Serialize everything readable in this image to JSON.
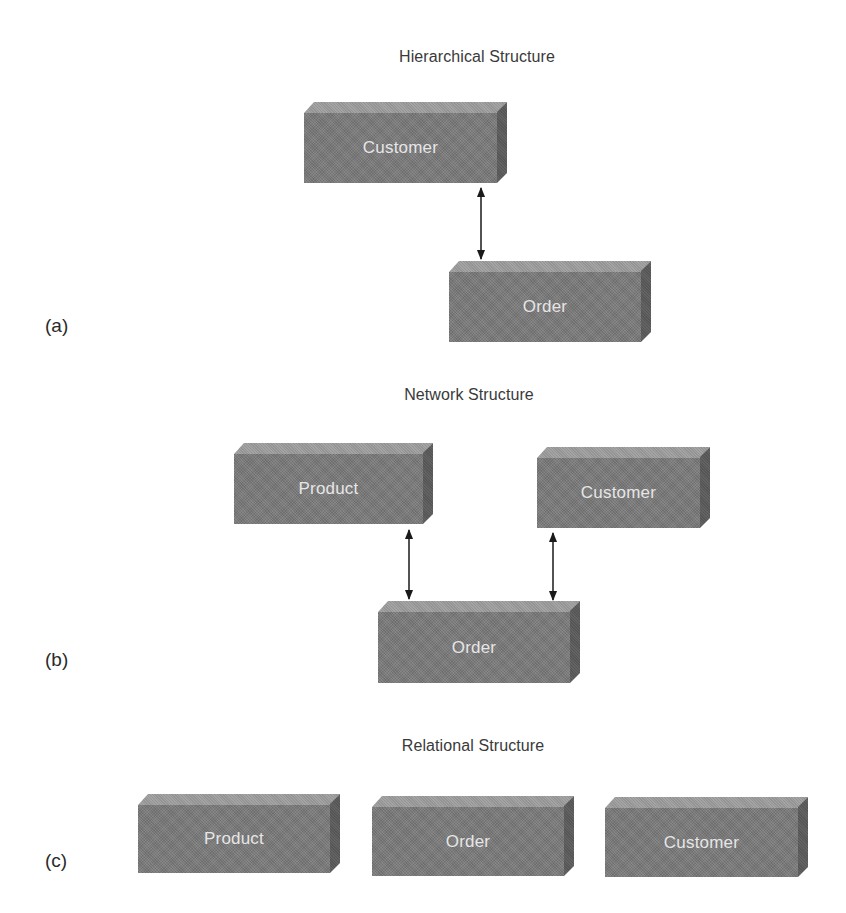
{
  "sections": [
    {
      "id": "a",
      "label": "(a)",
      "title": "Hierarchical Structure",
      "entities": [
        {
          "name": "Customer"
        },
        {
          "name": "Order"
        }
      ],
      "relationships": [
        {
          "from": "Customer",
          "to": "Order",
          "type": "bidirectional"
        }
      ]
    },
    {
      "id": "b",
      "label": "(b)",
      "title": "Network Structure",
      "entities": [
        {
          "name": "Product"
        },
        {
          "name": "Customer"
        },
        {
          "name": "Order"
        }
      ],
      "relationships": [
        {
          "from": "Product",
          "to": "Order",
          "type": "bidirectional"
        },
        {
          "from": "Customer",
          "to": "Order",
          "type": "bidirectional"
        }
      ]
    },
    {
      "id": "c",
      "label": "(c)",
      "title": "Relational Structure",
      "entities": [
        {
          "name": "Product"
        },
        {
          "name": "Order"
        },
        {
          "name": "Customer"
        }
      ],
      "relationships": []
    }
  ],
  "colors": {
    "box_front": "#7a7a7a",
    "box_top": "#9c9c9c",
    "box_side": "#5b5b5b",
    "box_text": "#e6e6e6",
    "arrow": "#1a1a1a",
    "title_text": "#3a3a3a"
  }
}
